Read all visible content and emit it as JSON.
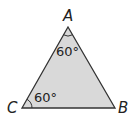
{
  "diagram": {
    "type": "triangle",
    "fill_color": "#d9d9d9",
    "stroke_color": "#333333",
    "vertices": [
      {
        "name": "A",
        "label": "A",
        "x": 68,
        "y": 27
      },
      {
        "name": "B",
        "label": "B",
        "x": 115,
        "y": 108
      },
      {
        "name": "C",
        "label": "C",
        "x": 22,
        "y": 108
      }
    ],
    "angles": [
      {
        "vertex": "A",
        "label": "60°"
      },
      {
        "vertex": "C",
        "label": "60°"
      }
    ]
  }
}
